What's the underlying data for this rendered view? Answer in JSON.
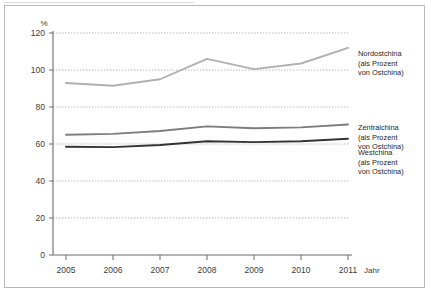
{
  "chart_data": {
    "type": "line",
    "title": "",
    "xlabel": "Jahr",
    "ylabel": "%",
    "x": [
      "2005",
      "2006",
      "2007",
      "2008",
      "2009",
      "2010",
      "2011"
    ],
    "categories": [
      "2005",
      "2006",
      "2007",
      "2008",
      "2009",
      "2010",
      "2011"
    ],
    "ylim": [
      0,
      120
    ],
    "yticks": [
      0,
      20,
      40,
      60,
      80,
      100,
      120
    ],
    "ytick_labels": [
      "0",
      "20",
      "40",
      "60",
      "80",
      "100",
      "120"
    ],
    "grid": true,
    "grid_style": "dotted-horizontal",
    "legend_position": "right",
    "series": [
      {
        "name": "Nordostchina (als Prozent von Ostchina)",
        "short_name": "Nordostchina",
        "qualifier": "(als Prozent von Ostchina)",
        "color": "#b0b0b0",
        "values": [
          93,
          91.5,
          95,
          106,
          100.5,
          103.5,
          112
        ]
      },
      {
        "name": "Zentralchina (als Prozent von Ostchina)",
        "short_name": "Zentralchina",
        "qualifier": "(als Prozent von Ostchina)",
        "color": "#7d7d7d",
        "values": [
          65,
          65.5,
          67,
          69.5,
          68.5,
          69,
          70.5
        ]
      },
      {
        "name": "Westchina (als Prozent von Ostchina)",
        "short_name": "Westchina",
        "qualifier": "(als Prozent von Ostchina)",
        "color": "#333333",
        "values": [
          58.5,
          58.3,
          59.5,
          61.5,
          61,
          61.5,
          62.8
        ]
      }
    ]
  },
  "axes": {
    "y_unit": "%",
    "x_unit": "Jahr",
    "y_ticks": [
      "120",
      "100",
      "80",
      "60",
      "40",
      "20",
      "0"
    ],
    "x_ticks": [
      "2005",
      "2006",
      "2007",
      "2008",
      "2009",
      "2010",
      "2011"
    ]
  },
  "legend": {
    "items": [
      {
        "label": "Nordostchina\n(als Prozent\nvon Ostchina)"
      },
      {
        "label": "Zentralchina\n(als Prozent\nvon Ostchina)"
      },
      {
        "label": "Westchina\n(als Prozent\nvon Ostchina)"
      }
    ]
  },
  "colors": {
    "frame": "#b9b9b9",
    "axis": "#6b6b6b",
    "grid": "#9a9aa8",
    "text": "#3c3c3c",
    "series_nordost": "#b0b0b0",
    "series_zentral": "#7d7d7d",
    "series_west": "#333333"
  }
}
